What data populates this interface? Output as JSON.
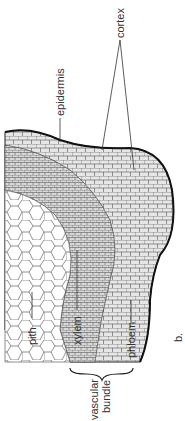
{
  "diagram": {
    "panel_label": "b.",
    "labels": {
      "cortex": "cortex",
      "epidermis": "epidermis",
      "pith": "pith",
      "xylem": "xylem",
      "phloem": "phloem",
      "vascular_bundle_line1": "vascular",
      "vascular_bundle_line2": "bundle"
    },
    "colors": {
      "line": "#333333",
      "cell_fill_light": "#ffffff",
      "cell_fill_dark": "#cfcfcf"
    }
  }
}
